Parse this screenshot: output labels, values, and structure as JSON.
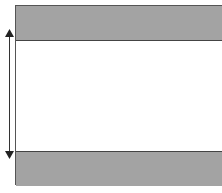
{
  "diagram": {
    "type": "dimension-band-diagram",
    "regions": [
      {
        "id": "top-band",
        "fill": "#a3a3a3",
        "label": ""
      },
      {
        "id": "middle-gap",
        "fill": "#ffffff",
        "label": ""
      },
      {
        "id": "bottom-band",
        "fill": "#a3a3a3",
        "label": ""
      }
    ],
    "dimension_indicator": {
      "orientation": "vertical",
      "arrows": [
        "up",
        "down"
      ],
      "color": "#333333"
    },
    "caption": ""
  }
}
